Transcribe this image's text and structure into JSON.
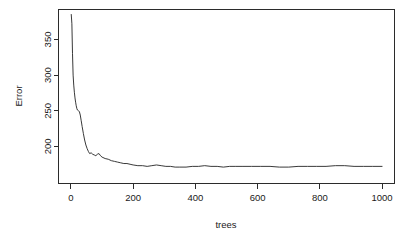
{
  "chart_data": {
    "type": "line",
    "title": "",
    "xlabel": "trees",
    "ylabel": "Error",
    "xlim": [
      -40,
      1040
    ],
    "ylim": [
      148,
      392
    ],
    "xticks": [
      0,
      200,
      400,
      600,
      800,
      1000
    ],
    "xtick_labels": [
      "0",
      "200",
      "400",
      "600",
      "800",
      "1000"
    ],
    "yticks": [
      200,
      250,
      300,
      350
    ],
    "ytick_labels": [
      "200",
      "250",
      "300",
      "350"
    ],
    "grid": false,
    "legend": null,
    "box": true,
    "series": [
      {
        "name": "OOB Error",
        "color": "#222222",
        "x": [
          1,
          3,
          5,
          7,
          9,
          11,
          13,
          15,
          17,
          19,
          21,
          24,
          27,
          30,
          33,
          36,
          40,
          44,
          48,
          52,
          56,
          60,
          65,
          70,
          75,
          80,
          85,
          90,
          95,
          100,
          110,
          120,
          130,
          140,
          150,
          160,
          170,
          180,
          190,
          200,
          215,
          230,
          245,
          260,
          275,
          290,
          305,
          320,
          335,
          350,
          370,
          390,
          410,
          430,
          450,
          470,
          490,
          510,
          530,
          550,
          580,
          610,
          640,
          670,
          700,
          730,
          760,
          790,
          820,
          850,
          880,
          910,
          940,
          970,
          1000
        ],
        "y": [
          385,
          372,
          330,
          300,
          286,
          276,
          268,
          262,
          257,
          253,
          251,
          250,
          249,
          244,
          236,
          228,
          218,
          209,
          202,
          197,
          193,
          190,
          191,
          189,
          188,
          187,
          189,
          190,
          187,
          185,
          183,
          182,
          180,
          179,
          178,
          177,
          176,
          176,
          175,
          174,
          173,
          173,
          172,
          173,
          174,
          173,
          172,
          172,
          171,
          171,
          171,
          172,
          172,
          173,
          172,
          172,
          171,
          172,
          172,
          172,
          172,
          172,
          172,
          171,
          171,
          172,
          172,
          172,
          172,
          173,
          173,
          172,
          172,
          172,
          172
        ]
      }
    ]
  },
  "axes": {
    "x_axis_name": "trees-axis",
    "y_axis_name": "error-axis"
  }
}
